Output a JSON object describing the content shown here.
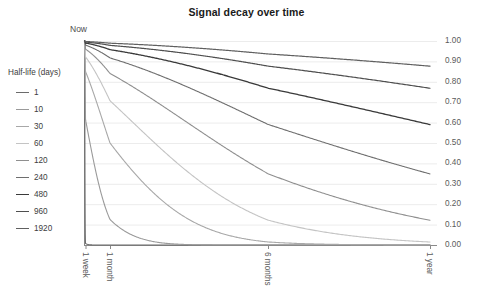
{
  "chart_data": {
    "type": "line",
    "title": "Signal decay over time",
    "xlabel": "",
    "ylabel": "",
    "grid": true,
    "legend_position": "left",
    "legend_title": "Half-life (days)",
    "origin_label": "Now",
    "ylim": [
      0.0,
      1.0
    ],
    "yticks": [
      1.0,
      0.9,
      0.8,
      0.7,
      0.6,
      0.5,
      0.4,
      0.3,
      0.2,
      0.1,
      0.0
    ],
    "ytick_labels": [
      "1.00",
      "0.90",
      "0.80",
      "0.70",
      "0.60",
      "0.50",
      "0.40",
      "0.30",
      "0.20",
      "0.10",
      "0.00"
    ],
    "xtick_labels": [
      "1 week",
      "1 month",
      "6 months",
      "1 year"
    ],
    "xtick_days": [
      7,
      30,
      182,
      365
    ],
    "xlim_days": [
      0,
      365
    ],
    "x_days": [
      0,
      1,
      2,
      3,
      4,
      5,
      7,
      10,
      14,
      21,
      30,
      45,
      60,
      90,
      120,
      150,
      182,
      210,
      240,
      270,
      300,
      330,
      365
    ],
    "series": [
      {
        "name": "1",
        "half_life_days": 1,
        "color": "#6b6b6b",
        "width": 1.1,
        "values": [
          1.0,
          0.5,
          0.25,
          0.125,
          0.063,
          0.031,
          0.008,
          0.001,
          0.0,
          0.0,
          0.0,
          0.0,
          0.0,
          0.0,
          0.0,
          0.0,
          0.0,
          0.0,
          0.0,
          0.0,
          0.0,
          0.0,
          0.0
        ]
      },
      {
        "name": "10",
        "half_life_days": 10,
        "color": "#9a9a9a",
        "width": 1.1,
        "values": [
          1.0,
          0.933,
          0.871,
          0.812,
          0.758,
          0.707,
          0.616,
          0.5,
          0.379,
          0.232,
          0.125,
          0.044,
          0.016,
          0.002,
          0.0,
          0.0,
          0.0,
          0.0,
          0.0,
          0.0,
          0.0,
          0.0,
          0.0
        ]
      },
      {
        "name": "30",
        "half_life_days": 30,
        "color": "#a8a8a8",
        "width": 1.1,
        "values": [
          1.0,
          0.977,
          0.955,
          0.933,
          0.912,
          0.891,
          0.851,
          0.794,
          0.722,
          0.615,
          0.5,
          0.354,
          0.25,
          0.125,
          0.063,
          0.031,
          0.015,
          0.008,
          0.004,
          0.002,
          0.001,
          0.0,
          0.0
        ]
      },
      {
        "name": "60",
        "half_life_days": 60,
        "color": "#c4c4c4",
        "width": 1.1,
        "values": [
          1.0,
          0.989,
          0.977,
          0.966,
          0.955,
          0.944,
          0.923,
          0.891,
          0.851,
          0.784,
          0.707,
          0.595,
          0.5,
          0.354,
          0.25,
          0.177,
          0.123,
          0.089,
          0.063,
          0.044,
          0.031,
          0.022,
          0.015
        ]
      },
      {
        "name": "120",
        "half_life_days": 120,
        "color": "#8f8f8f",
        "width": 1.1,
        "values": [
          1.0,
          0.994,
          0.988,
          0.983,
          0.977,
          0.972,
          0.96,
          0.944,
          0.923,
          0.886,
          0.841,
          0.771,
          0.707,
          0.595,
          0.5,
          0.42,
          0.351,
          0.298,
          0.25,
          0.21,
          0.177,
          0.149,
          0.122
        ]
      },
      {
        "name": "240",
        "half_life_days": 240,
        "color": "#6e6e6e",
        "width": 1.1,
        "values": [
          1.0,
          0.997,
          0.994,
          0.991,
          0.988,
          0.986,
          0.98,
          0.971,
          0.96,
          0.941,
          0.917,
          0.878,
          0.841,
          0.771,
          0.707,
          0.648,
          0.592,
          0.545,
          0.5,
          0.458,
          0.42,
          0.385,
          0.35
        ]
      },
      {
        "name": "480",
        "half_life_days": 480,
        "color": "#3a3a3a",
        "width": 1.3,
        "values": [
          1.0,
          0.999,
          0.997,
          0.996,
          0.994,
          0.993,
          0.99,
          0.986,
          0.98,
          0.97,
          0.958,
          0.937,
          0.917,
          0.878,
          0.841,
          0.805,
          0.769,
          0.738,
          0.707,
          0.677,
          0.648,
          0.621,
          0.591
        ]
      },
      {
        "name": "960",
        "half_life_days": 960,
        "color": "#4f4f4f",
        "width": 1.2,
        "values": [
          1.0,
          0.999,
          0.999,
          0.998,
          0.997,
          0.996,
          0.995,
          0.993,
          0.99,
          0.985,
          0.979,
          0.968,
          0.958,
          0.937,
          0.917,
          0.897,
          0.877,
          0.859,
          0.841,
          0.823,
          0.805,
          0.788,
          0.769
        ]
      },
      {
        "name": "1920",
        "half_life_days": 1920,
        "color": "#606060",
        "width": 1.2,
        "values": [
          1.0,
          1.0,
          0.999,
          0.999,
          0.999,
          0.998,
          0.997,
          0.996,
          0.995,
          0.992,
          0.989,
          0.984,
          0.979,
          0.968,
          0.958,
          0.947,
          0.937,
          0.927,
          0.917,
          0.907,
          0.897,
          0.888,
          0.877
        ]
      }
    ]
  }
}
